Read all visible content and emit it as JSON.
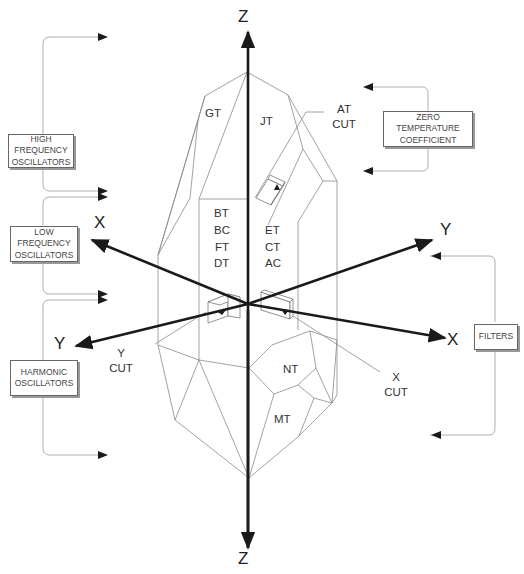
{
  "diagram": {
    "axes": {
      "z_top": "Z",
      "z_bottom": "Z",
      "x_left": "X",
      "x_right": "X",
      "y_left": "Y",
      "y_right": "Y"
    },
    "faces": {
      "gt": "GT",
      "jt": "JT",
      "left_group": [
        "BT",
        "BC",
        "FT",
        "DT"
      ],
      "right_group": [
        "ET",
        "CT",
        "AC"
      ],
      "nt": "NT",
      "mt": "MT"
    },
    "cuts": {
      "at": [
        "AT",
        "CUT"
      ],
      "y": [
        "Y",
        "CUT"
      ],
      "x": [
        "X",
        "CUT"
      ]
    },
    "applications": {
      "high_frequency": [
        "HIGH",
        "FREQUENCY",
        "OSCILLATORS"
      ],
      "low_frequency": [
        "LOW",
        "FREQUENCY",
        "OSCILLATORS"
      ],
      "harmonic": [
        "HARMONIC",
        "OSCILLATORS"
      ],
      "zero_temp": [
        "ZERO",
        "TEMPERATURE",
        "COEFFICIENT"
      ],
      "filters": [
        "FILTERS"
      ]
    },
    "colors": {
      "axis": "#1a1a1a",
      "edge": "#8a8a8a",
      "connector": "#999999",
      "text": "#333333"
    }
  }
}
